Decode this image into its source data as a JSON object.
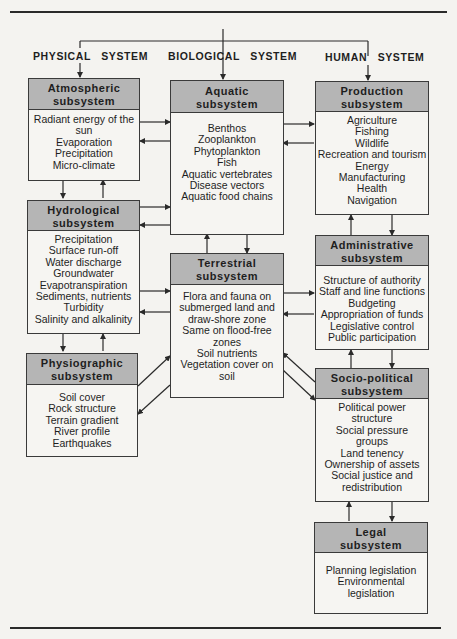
{
  "system_labels": {
    "physical": "PHYSICAL   SYSTEM",
    "biological": "BIOLOGICAL   SYSTEM",
    "human": "HUMAN   SYSTEM"
  },
  "boxes": {
    "atmospheric": {
      "title_1": "Atmospheric",
      "title_2": "subsystem",
      "items": [
        "Radiant energy of the",
        "sun",
        "Evaporation",
        "Precipitation",
        "Micro-climate"
      ]
    },
    "hydrological": {
      "title_1": "Hydrological",
      "title_2": "subsystem",
      "items": [
        "Precipitation",
        "Surface run-off",
        "Water discharge",
        "Groundwater",
        "Evapotranspiration",
        "Sediments, nutrients",
        "Turbidity",
        "Salinity and alkalinity"
      ]
    },
    "physiographic": {
      "title_1": "Physiographic",
      "title_2": "subsystem",
      "items": [
        "Soil cover",
        "Rock structure",
        "Terrain gradient",
        "River profile",
        "Earthquakes"
      ]
    },
    "aquatic": {
      "title_1": "Aquatic",
      "title_2": "subsystem",
      "items": [
        "Benthos",
        "Zooplankton",
        "Phytoplankton",
        "Fish",
        "Aquatic vertebrates",
        "Disease vectors",
        "Aquatic food chains"
      ]
    },
    "terrestrial": {
      "title_1": "Terrestrial",
      "title_2": "subsystem",
      "items": [
        "Flora and fauna on",
        "submerged land and",
        "draw-shore zone",
        "Same on flood-free",
        "zones",
        "Soil nutrients",
        "Vegetation cover on",
        "soil"
      ]
    },
    "production": {
      "title_1": "Production",
      "title_2": "subsystem",
      "items": [
        "Agriculture",
        "Fishing",
        "Wildlife",
        "Recreation and tourism",
        "Energy",
        "Manufacturing",
        "Health",
        "Navigation"
      ]
    },
    "administrative": {
      "title_1": "Administrative",
      "title_2": "subsystem",
      "items": [
        "Structure of authority",
        "Staff and line functions",
        "Budgeting",
        "Appropriation of funds",
        "Legislative control",
        "Public participation"
      ]
    },
    "sociopolitical": {
      "title_1": "Socio-political",
      "title_2": "subsystem",
      "items": [
        "Political power",
        "structure",
        "Social pressure",
        "groups",
        "Land tenency",
        "Ownership of assets",
        "Social justice and",
        "redistribution"
      ]
    },
    "legal": {
      "title_1": "Legal",
      "title_2": "subsystem",
      "items": [
        "Planning legislation",
        "Environmental",
        "legislation"
      ]
    }
  },
  "colors": {
    "header_fill": "#b5b5b5",
    "line": "#2a2a2a",
    "paper": "#f4f3f0"
  }
}
